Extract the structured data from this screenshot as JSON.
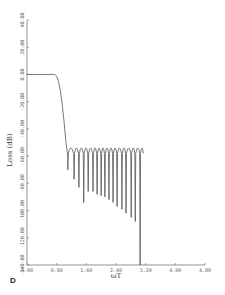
{
  "panel_label": "D",
  "chart_data": {
    "type": "line",
    "title": "",
    "xlabel": "ωT",
    "ylabel": "Loss (dB)",
    "xlim": [
      0.0,
      4.8
    ],
    "ylim": [
      -140.0,
      40.0
    ],
    "grid": false,
    "legend": null,
    "x_ticks": [
      0.0,
      0.8,
      1.6,
      2.4,
      3.2,
      4.0,
      4.8
    ],
    "x_tick_labels": [
      "0.00",
      "0.80",
      "1.60",
      "2.40",
      "3.20",
      "4.00",
      "4.80"
    ],
    "y_ticks": [
      40,
      20,
      0,
      -20,
      -40,
      -60,
      -80,
      -100,
      -120,
      -140
    ],
    "y_tick_labels": [
      "40.00",
      "20.00",
      "0.00",
      "-20.00",
      "-40.00",
      "-60.00",
      "-80.00",
      "-100.00",
      "-120.00",
      "-140.00"
    ],
    "series": [
      {
        "name": "Loss",
        "color": "#555555",
        "passband": {
          "x_end": 0.75,
          "level_db": 0.0
        },
        "transition": [
          [
            0.75,
            0.0
          ],
          [
            0.8,
            -1.5
          ],
          [
            0.85,
            -5
          ],
          [
            0.9,
            -12
          ],
          [
            0.95,
            -22
          ],
          [
            1.0,
            -35
          ],
          [
            1.05,
            -50
          ],
          [
            1.1,
            -60
          ]
        ],
        "stopband_peak_db": -54,
        "stopband_end_x": 3.15,
        "nulls": [
          {
            "x": 1.1,
            "db": -70
          },
          {
            "x": 1.27,
            "db": -77
          },
          {
            "x": 1.4,
            "db": -83
          },
          {
            "x": 1.53,
            "db": -94
          },
          {
            "x": 1.65,
            "db": -86
          },
          {
            "x": 1.78,
            "db": -86
          },
          {
            "x": 1.89,
            "db": -88
          },
          {
            "x": 2.0,
            "db": -89
          },
          {
            "x": 2.1,
            "db": -90
          },
          {
            "x": 2.21,
            "db": -92
          },
          {
            "x": 2.32,
            "db": -94
          },
          {
            "x": 2.43,
            "db": -97
          },
          {
            "x": 2.56,
            "db": -99
          },
          {
            "x": 2.67,
            "db": -102
          },
          {
            "x": 2.81,
            "db": -105
          },
          {
            "x": 2.92,
            "db": -108
          },
          {
            "x": 3.05,
            "db": -140
          }
        ]
      }
    ]
  }
}
